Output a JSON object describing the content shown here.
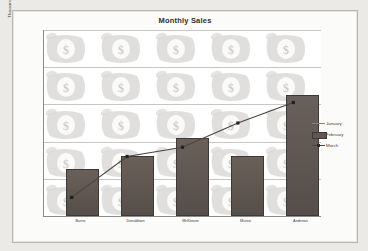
{
  "chart_data": {
    "type": "bar",
    "title": "Monthly Sales",
    "xlabel": "",
    "ylabel": "Thousands",
    "ylim": [
      50,
      100
    ],
    "yticks": [
      50,
      60,
      70,
      80,
      90,
      100
    ],
    "ytick_labels": [
      "50",
      "60",
      "70",
      "80",
      "90",
      "100"
    ],
    "grid": true,
    "legend_position": "right",
    "categories": [
      "Burns",
      "Donaldson",
      "McKenzie",
      "Munro",
      "Andrews"
    ],
    "series": [
      {
        "name": "January",
        "type": "line",
        "values": [
          null,
          null,
          null,
          null,
          null
        ],
        "color": "#8a8076"
      },
      {
        "name": "February",
        "type": "bar",
        "values": [
          62,
          65.5,
          70.5,
          65.5,
          82
        ],
        "color": "#5f5651"
      },
      {
        "name": "March",
        "type": "line",
        "values": [
          55,
          66,
          68.5,
          75,
          80.5
        ],
        "color": "#4a443f"
      }
    ]
  },
  "legend": {
    "items": [
      {
        "label": "January",
        "key": "line-key"
      },
      {
        "label": "February",
        "key": "bar-swatch-key"
      },
      {
        "label": "March",
        "key": "line-marker-key"
      }
    ]
  }
}
